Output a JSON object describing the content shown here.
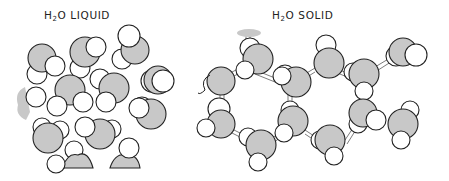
{
  "labels": {
    "liquid": {
      "prefix": "H",
      "subscript": "2",
      "suffix": "O LIQUID"
    },
    "solid": {
      "prefix": "H",
      "subscript": "2",
      "suffix": "O SOLID"
    }
  },
  "colors": {
    "oxygen": "#c8c8c8",
    "hydrogen": "#ffffff",
    "outline": "#222222"
  },
  "panels": [
    {
      "name": "liquid",
      "description": "Disordered water molecules (oxygen gray, hydrogen white)"
    },
    {
      "name": "solid",
      "description": "Hexagonal ice lattice with hydrogen bonds"
    }
  ]
}
